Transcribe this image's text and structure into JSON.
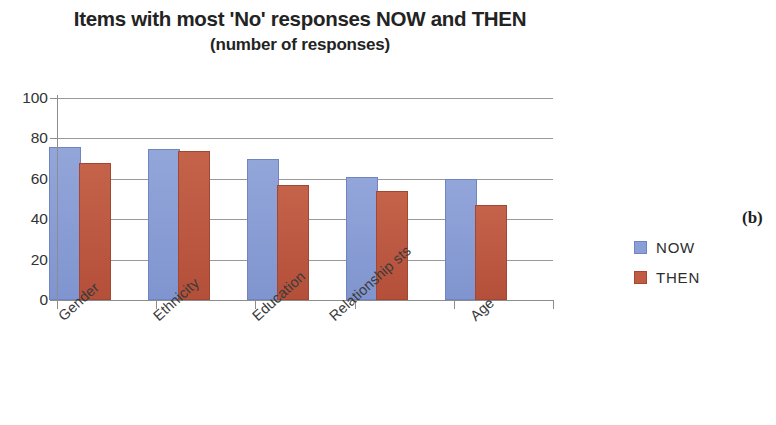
{
  "chart_data": {
    "type": "bar",
    "title": "Items with most 'No' responses NOW and THEN",
    "subtitle": "(number of responses)",
    "xlabel": "",
    "ylabel": "",
    "ylim": [
      0,
      100
    ],
    "ytick_step": 20,
    "yticks": [
      0,
      20,
      40,
      60,
      80,
      100
    ],
    "ytick_labels": [
      "0",
      "20",
      "40",
      "60",
      "80",
      "100"
    ],
    "grid": true,
    "grid_axis": "y",
    "legend_position": "right",
    "categories": [
      "Gender",
      "Ethnicity",
      "Education",
      "Relationship sts",
      "Age"
    ],
    "series": [
      {
        "name": "NOW",
        "color": "#8b9fd7",
        "values": [
          75,
          74,
          69,
          60,
          59
        ]
      },
      {
        "name": "THEN",
        "color": "#c05c42",
        "values": [
          67,
          73,
          56,
          53,
          46
        ]
      }
    ]
  },
  "legend": {
    "items": [
      {
        "label": "NOW",
        "color": "#8b9fd7"
      },
      {
        "label": "THEN",
        "color": "#c05c42"
      }
    ]
  },
  "figure": {
    "panel_caption": "(b)"
  }
}
